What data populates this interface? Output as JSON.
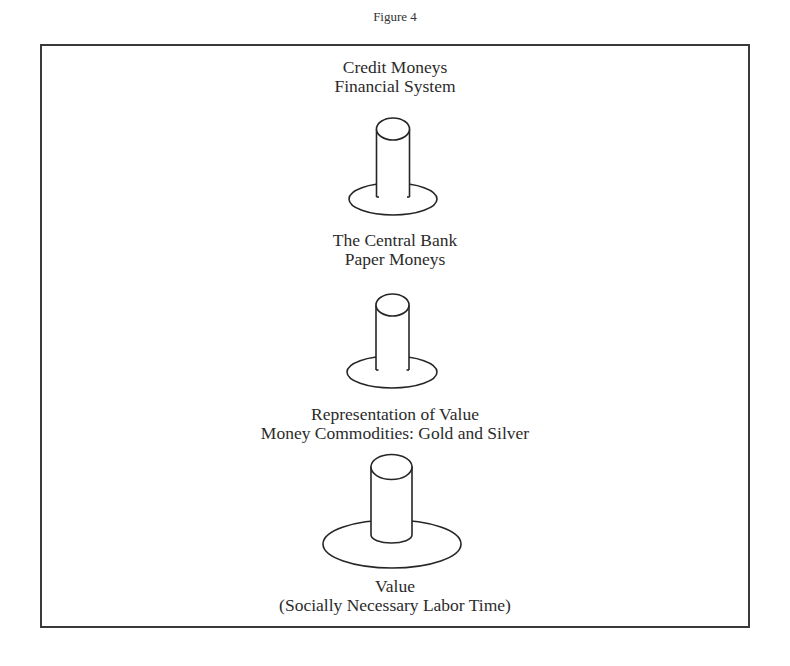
{
  "figure": {
    "caption": "Figure 4"
  },
  "levels": [
    {
      "id": "credit",
      "line1": "Credit Moneys",
      "line2": "Financial System",
      "icon": "pedestal-small-icon"
    },
    {
      "id": "central-bank",
      "line1": "The Central Bank",
      "line2": "Paper Moneys",
      "icon": "pedestal-small-icon"
    },
    {
      "id": "commodity",
      "line1": "Representation of Value",
      "line2": "Money Commodities: Gold and Silver",
      "icon": "pedestal-large-icon"
    },
    {
      "id": "value",
      "line1": "Value",
      "line2": "(Socially Necessary Labor Time)"
    }
  ],
  "colors": {
    "stroke": "#262626",
    "text": "#2b2b2b",
    "background": "#ffffff"
  }
}
